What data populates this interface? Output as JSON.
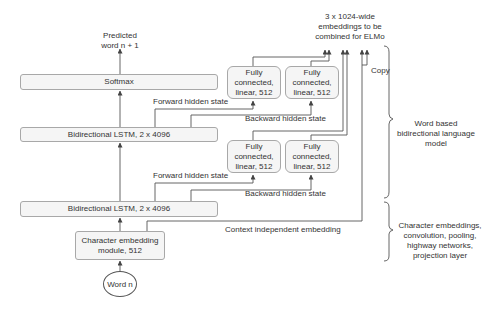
{
  "diagram": {
    "output_label": "Predicted\nword n + 1",
    "softmax": "Softmax",
    "bilstm_top": "Bidirectional LSTM, 2 x 4096",
    "bilstm_bottom": "Bidirectional LSTM, 2 x 4096",
    "char_embedding": "Character embedding module, 512",
    "input": "Word n",
    "fc_top_left": "Fully connected, linear, 512",
    "fc_top_right": "Fully connected, linear, 512",
    "fc_bottom_left": "Fully connected, linear, 512",
    "fc_bottom_right": "Fully connected, linear, 512",
    "forward_top": "Forward hidden state",
    "backward_top": "Backward hidden state",
    "forward_bottom": "Forward hidden state",
    "backward_bottom": "Backward hidden state",
    "context_independent": "Context independent embedding",
    "embeddings_label": "3 x 1024-wide embeddings to be combined for ELMo",
    "copy": "Copy",
    "brace_word_model": "Word based bidirectional language model",
    "brace_char_model": "Character embeddings, convolution, pooling, highway networks, projection layer"
  },
  "colors": {
    "line": "#555555",
    "box_fill": "#f5f5f5",
    "box_border": "#a8a8a8",
    "text": "#333333"
  }
}
